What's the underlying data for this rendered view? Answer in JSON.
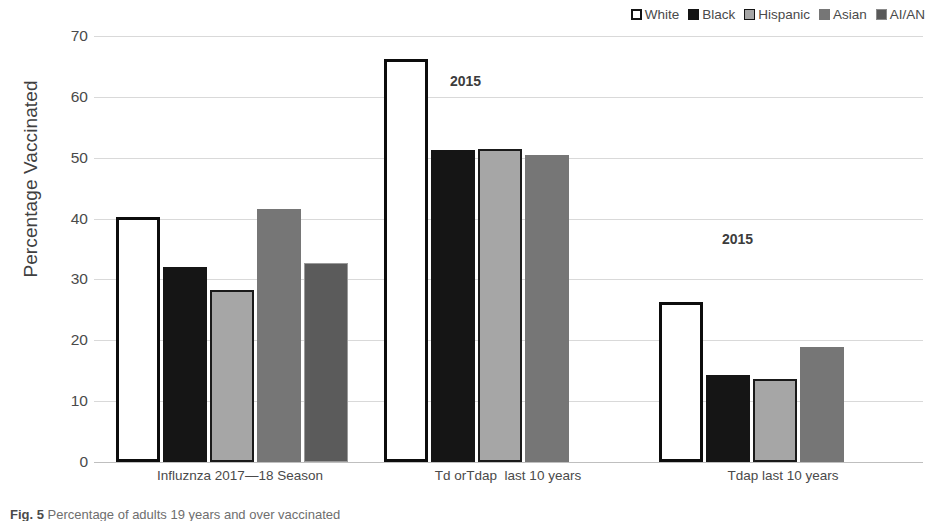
{
  "legend": {
    "position": "top-right",
    "entries": [
      {
        "label": "White",
        "swatch": "white-swatch-icon",
        "color": "#ffffff"
      },
      {
        "label": "Black",
        "swatch": "black-swatch-icon",
        "color": "#141414"
      },
      {
        "label": "Hispanic",
        "swatch": "hispanic-swatch-icon",
        "color": "#a6a6a6"
      },
      {
        "label": "Asian",
        "swatch": "asian-swatch-icon",
        "color": "#767676"
      },
      {
        "label": "AI/AN",
        "swatch": "aian-swatch-icon",
        "color": "#595959"
      }
    ]
  },
  "axes": {
    "ylabel": "Percentage Vaccinated",
    "yticks": [
      "0",
      "10",
      "20",
      "30",
      "40",
      "50",
      "60",
      "70"
    ],
    "xlabel": ""
  },
  "annotations": [
    {
      "text": "2015",
      "group": "Td orTdap  last 10 years"
    },
    {
      "text": "2015",
      "group": "Tdap last 10 years"
    }
  ],
  "caption": {
    "lead": "Fig. 5",
    "text": "Percentage of adults 19 years and over vaccinated"
  },
  "chart_data": {
    "type": "bar",
    "title": "",
    "subtitle": "",
    "xlabel": "",
    "ylabel": "Percentage Vaccinated",
    "ylim": [
      0,
      70
    ],
    "ytick_step": 10,
    "grid": true,
    "legend_position": "top-right",
    "categories": [
      "Influznza 2017—18 Season",
      "Td orTdap  last 10 years",
      "Tdap last 10 years"
    ],
    "series": [
      {
        "name": "White",
        "color": "#ffffff",
        "values": [
          40.2,
          66.3,
          26.3
        ]
      },
      {
        "name": "Black",
        "color": "#141414",
        "values": [
          32.0,
          51.3,
          14.3
        ]
      },
      {
        "name": "Hispanic",
        "color": "#a6a6a6",
        "values": [
          28.2,
          51.5,
          13.6
        ]
      },
      {
        "name": "Asian",
        "color": "#767676",
        "values": [
          41.6,
          50.4,
          18.9
        ]
      },
      {
        "name": "AI/AN",
        "color": "#595959",
        "values": [
          32.7,
          null,
          null
        ]
      }
    ],
    "annotations": [
      {
        "text": "2015",
        "category": "Td orTdap  last 10 years",
        "y": 64
      },
      {
        "text": "2015",
        "category": "Tdap last 10 years",
        "y": 38
      }
    ]
  }
}
